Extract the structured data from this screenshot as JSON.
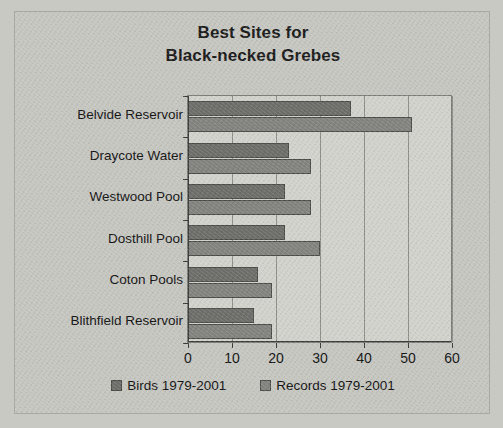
{
  "chart_data": {
    "type": "bar",
    "orientation": "horizontal",
    "title": "Best Sites for Black-necked Grebes",
    "title_lines": [
      "Best Sites for",
      "Black-necked Grebes"
    ],
    "xlabel": "",
    "ylabel": "",
    "categories": [
      "Belvide Reservoir",
      "Draycote Water",
      "Westwood Pool",
      "Dosthill Pool",
      "Coton Pools",
      "Blithfield Reservoir"
    ],
    "series": [
      {
        "name": "Birds 1979-2001",
        "color": "#6e6e6b",
        "values": [
          37,
          23,
          22,
          22,
          16,
          15
        ]
      },
      {
        "name": "Records 1979-2001",
        "color": "#838380",
        "values": [
          51,
          28,
          28,
          30,
          19,
          19
        ]
      }
    ],
    "xlim": [
      0,
      60
    ],
    "xticks": [
      0,
      10,
      20,
      30,
      40,
      50,
      60
    ],
    "xtick_labels": [
      "0",
      "10",
      "20",
      "30",
      "40",
      "50",
      "60"
    ],
    "grid": true,
    "grid_axis": "x",
    "legend_position": "bottom",
    "legend": [
      "Birds 1979-2001",
      "Records 1979-2001"
    ],
    "plot_background": "#d2d2cd",
    "figure_background": "#c6c6c1"
  }
}
